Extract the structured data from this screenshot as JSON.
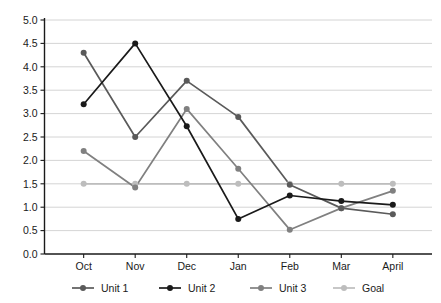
{
  "chart_data": {
    "type": "line",
    "title": "",
    "subtitle": "",
    "xlabel": "",
    "ylabel": "",
    "categories": [
      "Oct",
      "Nov",
      "Dec",
      "Jan",
      "Feb",
      "Mar",
      "April"
    ],
    "ylim": [
      0.0,
      5.0
    ],
    "ytick_labels": [
      "5.0",
      "4.5",
      "4.0",
      "3.5",
      "3.0",
      "2.5",
      "2.0",
      "1.5",
      "1.0",
      "0.5",
      "0.0"
    ],
    "ytick_values": [
      5.0,
      4.5,
      4.0,
      3.5,
      3.0,
      2.5,
      2.0,
      1.5,
      1.0,
      0.5,
      0.0
    ],
    "grid": true,
    "grid_axis": "y",
    "legend_position": "bottom",
    "series": [
      {
        "name": "Unit 1",
        "color": "#5a5a5a",
        "values": [
          4.3,
          2.5,
          3.7,
          2.93,
          1.48,
          0.98,
          0.85
        ]
      },
      {
        "name": "Unit 2",
        "color": "#1a1a1a",
        "values": [
          3.2,
          4.5,
          2.73,
          0.75,
          1.25,
          1.13,
          1.05
        ]
      },
      {
        "name": "Unit 3",
        "color": "#808080",
        "values": [
          2.2,
          1.42,
          3.1,
          1.82,
          0.52,
          0.98,
          1.35
        ]
      },
      {
        "name": "Goal",
        "color": "#bdbdbd",
        "values": [
          1.5,
          1.5,
          1.5,
          1.5,
          1.5,
          1.5,
          1.5
        ]
      }
    ]
  },
  "legend": {
    "items": [
      {
        "label": "Unit 1",
        "color": "#5a5a5a"
      },
      {
        "label": "Unit 2",
        "color": "#1a1a1a"
      },
      {
        "label": "Unit 3",
        "color": "#808080"
      },
      {
        "label": "Goal",
        "color": "#bdbdbd"
      }
    ]
  },
  "colors": {
    "background": "#ffffff",
    "axis": "#1a1a1a",
    "grid": "#c9c9c9",
    "text": "#1a1a1a"
  }
}
